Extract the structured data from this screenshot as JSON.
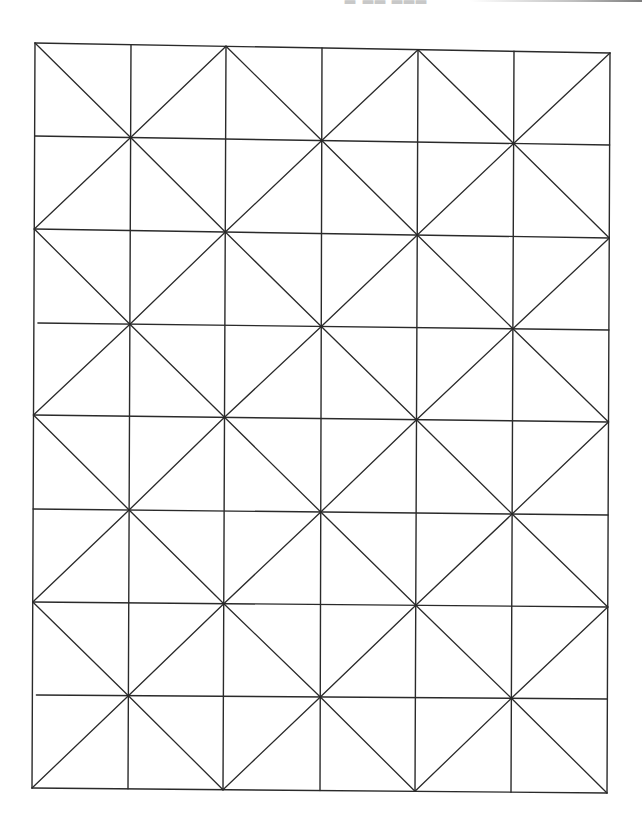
{
  "page": {
    "width": 642,
    "height": 830,
    "background": "#ffffff"
  },
  "header": {
    "fragment_text": "▃ ▃▃ ▃▃▃",
    "fragment_color": "#c8c8c8",
    "scan_bar_visible": true
  },
  "diagram": {
    "type": "grid-with-alternating-diagonals",
    "columns": 6,
    "rows": 8,
    "stroke_color": "#2a2a2a",
    "stroke_width": 1.4,
    "diagonal_stroke_width": 1.3,
    "corners": {
      "top_left": [
        35,
        43
      ],
      "top_right": [
        610,
        53
      ],
      "bottom_left": [
        32,
        788
      ],
      "bottom_right": [
        607,
        793
      ]
    },
    "vertical_lines_top_x": [
      35,
      131,
      226,
      322,
      418,
      514,
      610
    ],
    "vertical_lines_bottom_x": [
      32,
      128,
      223,
      320,
      415,
      511,
      607
    ],
    "horizontal_lines_left_y": [
      43,
      136,
      229,
      323,
      415,
      509,
      602,
      695,
      788
    ],
    "horizontal_lines_right_y": [
      53,
      145,
      238,
      330,
      422,
      515,
      607,
      699,
      793
    ],
    "horizontal_left_gaps": {
      "3": 4,
      "7": 4
    },
    "diagonal_rule": "cell (row,col) with (row+col) even runs top-left to bottom-right; odd runs bottom-left to top-right",
    "first_cell_diagonal": "top-left-to-bottom-right"
  }
}
